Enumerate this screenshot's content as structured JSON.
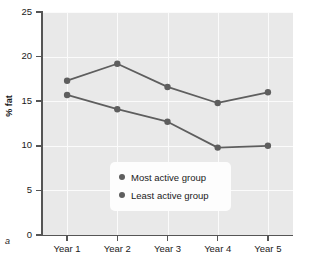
{
  "panel": {
    "letter": "a"
  },
  "chart_data": {
    "type": "line",
    "title": "",
    "xlabel": "",
    "ylabel": "% fat",
    "categories": [
      "Year 1",
      "Year 2",
      "Year 3",
      "Year 4",
      "Year 5"
    ],
    "ylim": [
      0,
      25
    ],
    "yticks": [
      0,
      5,
      10,
      15,
      20,
      25
    ],
    "ytick_labels": [
      "0",
      "5",
      "10",
      "15",
      "20",
      "25"
    ],
    "grid": true,
    "legend_position": "lower center",
    "series": [
      {
        "name": "Most active group",
        "values": [
          17.3,
          19.2,
          16.6,
          14.8,
          16.0
        ],
        "color": "#5e5e5e"
      },
      {
        "name": "Least active group",
        "values": [
          15.7,
          14.1,
          12.7,
          9.8,
          10.0
        ],
        "color": "#5e5e5e"
      }
    ],
    "colors": {
      "plot_background": "#e9e9e9",
      "gridline": "#fbfbfb",
      "axis": "#555555",
      "series_line": "#5e5e5e",
      "legend_background": "#fdfdfd",
      "text": "#1a1a1a"
    }
  }
}
